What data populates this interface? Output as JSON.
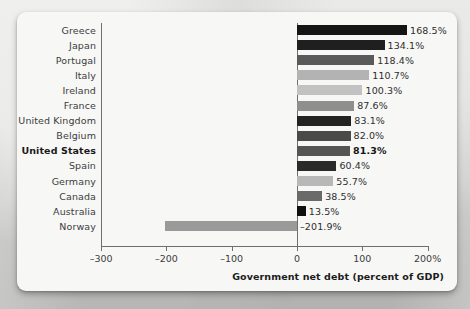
{
  "chart_data": {
    "type": "bar",
    "orientation": "horizontal",
    "title": "",
    "xlabel": "Government net debt (percent of GDP)",
    "ylabel": "",
    "xlim": [
      -300,
      200
    ],
    "xticks": [
      -300,
      -200,
      -100,
      0,
      100,
      200
    ],
    "xticklabels": [
      "–300",
      "–200",
      "–100",
      "0",
      "100",
      "200%"
    ],
    "grid": false,
    "legend": null,
    "categories": [
      "Greece",
      "Japan",
      "Portugal",
      "Italy",
      "Ireland",
      "France",
      "United Kingdom",
      "Belgium",
      "United States",
      "Spain",
      "Germany",
      "Canada",
      "Australia",
      "Norway"
    ],
    "values": [
      168.5,
      134.1,
      118.4,
      110.7,
      100.3,
      87.6,
      83.1,
      82.0,
      81.3,
      60.4,
      55.7,
      38.5,
      13.5,
      -201.9
    ],
    "value_labels": [
      "168.5%",
      "134.1%",
      "118.4%",
      "110.7%",
      "100.3%",
      "87.6%",
      "83.1%",
      "82.0%",
      "81.3%",
      "60.4%",
      "55.7%",
      "38.5%",
      "13.5%",
      "–201.9%"
    ],
    "bar_colors": [
      "#151515",
      "#1f1f1f",
      "#5a5a5a",
      "#b3b3b3",
      "#c2c2c2",
      "#8f8f8f",
      "#232323",
      "#4a4a4a",
      "#555555",
      "#2a2a2a",
      "#b8b8b8",
      "#6a6a6a",
      "#101010",
      "#9a9a9a"
    ],
    "highlight_category": "United States",
    "axis_color": "#6f6f6f",
    "plot_background": "#f7f7f6"
  }
}
